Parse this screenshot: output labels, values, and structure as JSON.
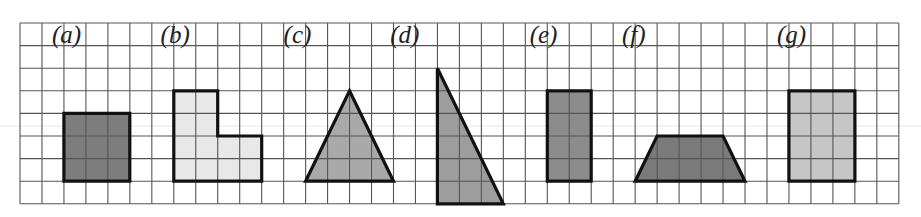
{
  "figure": {
    "grid": {
      "origin_x": 20,
      "origin_y": 23,
      "cell_w": 21.97,
      "cell_h": 22.6,
      "cols": 40,
      "rows": 8,
      "line_color": "#555555"
    },
    "artifact_line": {
      "y": 126,
      "color": "#e6e6e6"
    },
    "shapes": [
      {
        "id": "a",
        "label": "(a)",
        "type": "square",
        "fill": "#7d7d7d",
        "label_pos": [
          1.45,
          0.9
        ],
        "points": [
          [
            2,
            3
          ],
          [
            5,
            3
          ],
          [
            5,
            6
          ],
          [
            2,
            6
          ]
        ]
      },
      {
        "id": "b",
        "label": "(b)",
        "type": "l-shape",
        "fill": "#e8e8e8",
        "label_pos": [
          6.4,
          0.9
        ],
        "points": [
          [
            7,
            2
          ],
          [
            9,
            2
          ],
          [
            9,
            4
          ],
          [
            11,
            4
          ],
          [
            11,
            6
          ],
          [
            7,
            6
          ]
        ]
      },
      {
        "id": "c",
        "label": "(c)",
        "type": "isosceles-triangle",
        "fill": "#a9a9a9",
        "label_pos": [
          12.0,
          0.9
        ],
        "points": [
          [
            15,
            2
          ],
          [
            17,
            6
          ],
          [
            13,
            6
          ]
        ]
      },
      {
        "id": "d",
        "label": "(d)",
        "type": "right-triangle",
        "fill": "#9d9d9d",
        "label_pos": [
          16.85,
          0.9
        ],
        "points": [
          [
            19,
            1
          ],
          [
            22,
            7
          ],
          [
            19,
            7
          ]
        ]
      },
      {
        "id": "e",
        "label": "(e)",
        "type": "rectangle",
        "fill": "#8c8c8c",
        "label_pos": [
          23.2,
          0.9
        ],
        "points": [
          [
            24,
            2
          ],
          [
            26,
            2
          ],
          [
            26,
            6
          ],
          [
            24,
            6
          ]
        ]
      },
      {
        "id": "f",
        "label": "(f)",
        "type": "trapezoid",
        "fill": "#7a7a7a",
        "label_pos": [
          27.4,
          0.9
        ],
        "points": [
          [
            29,
            4
          ],
          [
            32,
            4
          ],
          [
            33,
            6
          ],
          [
            28,
            6
          ]
        ]
      },
      {
        "id": "g",
        "label": "(g)",
        "type": "rectangle",
        "fill": "#c6c6c6",
        "label_pos": [
          34.45,
          0.9
        ],
        "points": [
          [
            35,
            2
          ],
          [
            38,
            2
          ],
          [
            38,
            6
          ],
          [
            35,
            6
          ]
        ]
      }
    ]
  }
}
